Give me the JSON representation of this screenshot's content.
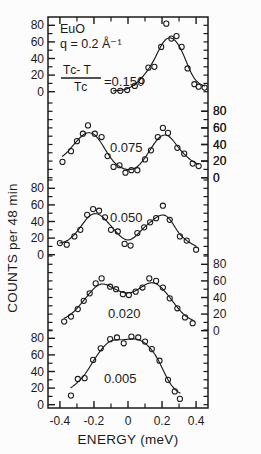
{
  "figure": {
    "sample_label": "EuO",
    "q_label": "q = 0.2 Å⁻¹",
    "ratio_numerator": "Tᴄ- T",
    "ratio_denominator": "Tᴄ",
    "ratio_equals": "=0.150",
    "xlabel": "ENERGY  (meV)",
    "ylabel": "COUNTS  per  48 min"
  },
  "axes": {
    "x_ticks": [
      "-0.4",
      "-0.2",
      "0",
      "0.2",
      "0.4"
    ],
    "x_tick_values": [
      -0.4,
      -0.2,
      0,
      0.2,
      0.4
    ],
    "x_minor_values": [
      -0.3,
      -0.1,
      0.1,
      0.3
    ],
    "xlim": [
      -0.47,
      0.47
    ],
    "left_tick_labels": [
      "0",
      "20",
      "40",
      "60",
      "80"
    ],
    "right_tick_labels": [
      "0",
      "20",
      "40",
      "60",
      "80"
    ],
    "left_group_count": 3,
    "right_group_count": 3
  },
  "chart_data": {
    "type": "line",
    "xlabel": "ENERGY  (meV)",
    "ylabel": "COUNTS  per  48 min",
    "xlim": [
      -0.47,
      0.47
    ],
    "ylim": [
      0,
      90
    ],
    "grid": false,
    "legend": "inline-annotations",
    "marker": "open-circle",
    "series": [
      {
        "name": "0.150",
        "label": "=0.150",
        "offset_index": 0,
        "points": [
          {
            "x": -0.085,
            "y": 1
          },
          {
            "x": -0.045,
            "y": 1
          },
          {
            "x": -0.005,
            "y": 2
          },
          {
            "x": 0.04,
            "y": 7
          },
          {
            "x": 0.08,
            "y": 13
          },
          {
            "x": 0.12,
            "y": 29
          },
          {
            "x": 0.155,
            "y": 30
          },
          {
            "x": 0.195,
            "y": 54
          },
          {
            "x": 0.225,
            "y": 82
          },
          {
            "x": 0.255,
            "y": 64
          },
          {
            "x": 0.285,
            "y": 67
          },
          {
            "x": 0.315,
            "y": 54
          },
          {
            "x": 0.35,
            "y": 28
          },
          {
            "x": 0.39,
            "y": 9
          },
          {
            "x": 0.415,
            "y": 6
          },
          {
            "x": 0.45,
            "y": 5
          }
        ]
      },
      {
        "name": "0.075",
        "label": "0.075",
        "offset_index": 1,
        "points": [
          {
            "x": -0.385,
            "y": 19
          },
          {
            "x": -0.335,
            "y": 32
          },
          {
            "x": -0.3,
            "y": 44
          },
          {
            "x": -0.265,
            "y": 53
          },
          {
            "x": -0.235,
            "y": 63
          },
          {
            "x": -0.195,
            "y": 53
          },
          {
            "x": -0.155,
            "y": 49
          },
          {
            "x": -0.12,
            "y": 26
          },
          {
            "x": -0.085,
            "y": 13
          },
          {
            "x": -0.05,
            "y": 15
          },
          {
            "x": -0.015,
            "y": 6
          },
          {
            "x": 0.02,
            "y": 9
          },
          {
            "x": 0.055,
            "y": 9
          },
          {
            "x": 0.1,
            "y": 22
          },
          {
            "x": 0.135,
            "y": 33
          },
          {
            "x": 0.175,
            "y": 49
          },
          {
            "x": 0.205,
            "y": 60
          },
          {
            "x": 0.235,
            "y": 54
          },
          {
            "x": 0.29,
            "y": 36
          },
          {
            "x": 0.33,
            "y": 29
          },
          {
            "x": 0.38,
            "y": 17
          },
          {
            "x": 0.415,
            "y": 14
          }
        ]
      },
      {
        "name": "0.050",
        "label": "0.050",
        "offset_index": 2,
        "points": [
          {
            "x": -0.4,
            "y": 14
          },
          {
            "x": -0.36,
            "y": 12
          },
          {
            "x": -0.315,
            "y": 22
          },
          {
            "x": -0.28,
            "y": 30
          },
          {
            "x": -0.24,
            "y": 48
          },
          {
            "x": -0.205,
            "y": 55
          },
          {
            "x": -0.17,
            "y": 53
          },
          {
            "x": -0.135,
            "y": 45
          },
          {
            "x": -0.1,
            "y": 30
          },
          {
            "x": -0.06,
            "y": 28
          },
          {
            "x": -0.02,
            "y": 13
          },
          {
            "x": 0.015,
            "y": 11
          },
          {
            "x": 0.055,
            "y": 26
          },
          {
            "x": 0.095,
            "y": 33
          },
          {
            "x": 0.13,
            "y": 39
          },
          {
            "x": 0.165,
            "y": 44
          },
          {
            "x": 0.205,
            "y": 59
          },
          {
            "x": 0.245,
            "y": 42
          },
          {
            "x": 0.305,
            "y": 22
          },
          {
            "x": 0.345,
            "y": 17
          },
          {
            "x": 0.4,
            "y": 6
          }
        ]
      },
      {
        "name": "0.020",
        "label": "0.020",
        "offset_index": 3,
        "points": [
          {
            "x": -0.375,
            "y": 11
          },
          {
            "x": -0.335,
            "y": 17
          },
          {
            "x": -0.295,
            "y": 26
          },
          {
            "x": -0.26,
            "y": 36
          },
          {
            "x": -0.225,
            "y": 45
          },
          {
            "x": -0.19,
            "y": 57
          },
          {
            "x": -0.155,
            "y": 63
          },
          {
            "x": -0.105,
            "y": 53
          },
          {
            "x": -0.07,
            "y": 50
          },
          {
            "x": -0.03,
            "y": 44
          },
          {
            "x": 0.005,
            "y": 43
          },
          {
            "x": 0.045,
            "y": 47
          },
          {
            "x": 0.085,
            "y": 52
          },
          {
            "x": 0.125,
            "y": 63
          },
          {
            "x": 0.165,
            "y": 60
          },
          {
            "x": 0.205,
            "y": 52
          },
          {
            "x": 0.245,
            "y": 39
          },
          {
            "x": 0.29,
            "y": 27
          },
          {
            "x": 0.335,
            "y": 16
          },
          {
            "x": 0.38,
            "y": 9
          }
        ]
      },
      {
        "name": "0.005",
        "label": "0.005",
        "offset_index": 4,
        "points": [
          {
            "x": -0.335,
            "y": 11
          },
          {
            "x": -0.295,
            "y": 31
          },
          {
            "x": -0.255,
            "y": 32
          },
          {
            "x": -0.205,
            "y": 54
          },
          {
            "x": -0.16,
            "y": 68
          },
          {
            "x": -0.105,
            "y": 79
          },
          {
            "x": -0.065,
            "y": 81
          },
          {
            "x": -0.025,
            "y": 74
          },
          {
            "x": 0.02,
            "y": 82
          },
          {
            "x": 0.06,
            "y": 81
          },
          {
            "x": 0.1,
            "y": 76
          },
          {
            "x": 0.14,
            "y": 67
          },
          {
            "x": 0.185,
            "y": 53
          },
          {
            "x": 0.235,
            "y": 30
          },
          {
            "x": 0.275,
            "y": 16
          },
          {
            "x": 0.305,
            "y": 7
          }
        ]
      }
    ]
  }
}
